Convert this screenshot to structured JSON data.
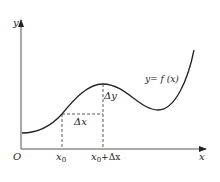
{
  "diagram": {
    "axes": {
      "y_label": "y",
      "x_label": "x",
      "origin_label": "O"
    },
    "ticks": {
      "x0_label": "x",
      "x0_sub": "0",
      "x0dx_label": "x",
      "x0dx_sub": "0",
      "x0dx_suffix": "+Δx"
    },
    "annotations": {
      "delta_x": "Δx",
      "delta_y": "Δy",
      "curve_label": "y= f (x)"
    },
    "colors": {
      "stroke": "#222222",
      "axis": "#555555",
      "background": "#ffffff"
    }
  }
}
